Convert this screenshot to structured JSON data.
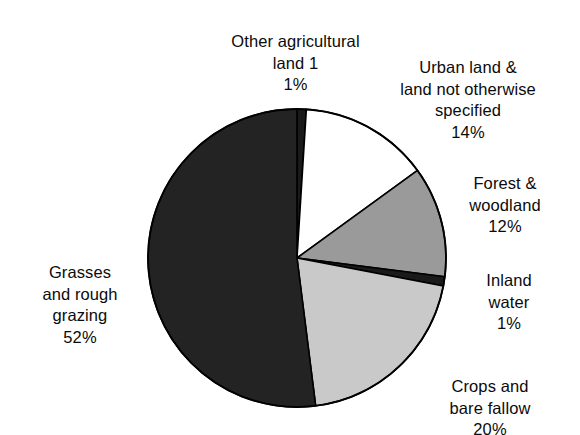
{
  "chart_data": {
    "type": "pie",
    "title": "",
    "subtitle": "",
    "xlabel": "",
    "ylabel": "",
    "legend_position": "none",
    "grid": false,
    "units": "percent",
    "start_angle_deg": 0,
    "direction": "clockwise",
    "categories": [
      "Other agricultural land 1",
      "Urban land & land not otherwise specified",
      "Forest & woodland",
      "Inland water",
      "Crops and bare fallow",
      "Grasses and rough grazing"
    ],
    "values": [
      1,
      14,
      12,
      1,
      20,
      52
    ],
    "slices": [
      {
        "name": "other-agricultural-land",
        "label_lines": "Other agricultural\nland 1",
        "value": 1,
        "value_label": "1%",
        "color": "#1a1a1a",
        "stroke": "#000000"
      },
      {
        "name": "urban-land",
        "label_lines": "Urban land &\nland not otherwise\nspecified",
        "value": 14,
        "value_label": "14%",
        "color": "#ffffff",
        "stroke": "#000000"
      },
      {
        "name": "forest-woodland",
        "label_lines": "Forest &\nwoodland",
        "value": 12,
        "value_label": "12%",
        "color": "#9a9a9a",
        "stroke": "#000000"
      },
      {
        "name": "inland-water",
        "label_lines": "Inland\nwater",
        "value": 1,
        "value_label": "1%",
        "color": "#1a1a1a",
        "stroke": "#000000"
      },
      {
        "name": "crops-bare-fallow",
        "label_lines": "Crops and\nbare fallow",
        "value": 20,
        "value_label": "20%",
        "color": "#c9c9c9",
        "stroke": "#000000"
      },
      {
        "name": "grasses-rough-grazing",
        "label_lines": "Grasses\nand rough\ngrazing",
        "value": 52,
        "value_label": "52%",
        "color": "#232323",
        "stroke": "#000000"
      }
    ]
  },
  "geometry": {
    "center_x": 297,
    "center_y": 258,
    "radius": 149
  },
  "colors": {
    "background": "#ffffff",
    "text": "#0b0b0b",
    "outline": "#000000"
  }
}
